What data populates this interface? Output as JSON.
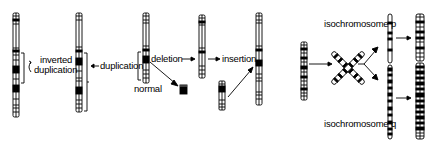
{
  "diagram": {
    "labels": {
      "inverted_duplication_line1": "inverted",
      "inverted_duplication_line2": "duplication",
      "duplication": "duplication",
      "normal": "normal",
      "deletion": "deletion",
      "insertion": "insertion",
      "isochromosome_p": "isochromosome p",
      "isochromosome_q": "isochromosome q"
    },
    "colors": {
      "ink": "#000000",
      "background": "#ffffff"
    },
    "chromosomes": [
      {
        "id": "inverted-duplication",
        "x": 13,
        "y": 13,
        "w": 6,
        "h": 104
      },
      {
        "id": "duplication",
        "x": 76,
        "y": 13,
        "w": 6,
        "h": 99
      },
      {
        "id": "normal",
        "x": 143,
        "y": 13,
        "w": 6,
        "h": 70
      },
      {
        "id": "deleted-fragment",
        "x": 180,
        "y": 85,
        "w": 7,
        "h": 9
      },
      {
        "id": "after-deletion",
        "x": 199,
        "y": 15,
        "w": 6,
        "h": 63
      },
      {
        "id": "insert-fragment",
        "x": 219,
        "y": 81,
        "w": 6,
        "h": 29
      },
      {
        "id": "after-insertion",
        "x": 256,
        "y": 13,
        "w": 6,
        "h": 92
      },
      {
        "id": "iso-source",
        "x": 301,
        "y": 42,
        "w": 6,
        "h": 58
      },
      {
        "id": "isochromosome-p",
        "x": 388,
        "y": 14,
        "w": 4,
        "h": 49
      },
      {
        "id": "isochromosome-q",
        "x": 388,
        "y": 63,
        "w": 4,
        "h": 76
      },
      {
        "id": "iso-p-result",
        "x": 416,
        "y": 14,
        "w": 8,
        "h": 47
      },
      {
        "id": "iso-q-result",
        "x": 416,
        "y": 63,
        "w": 8,
        "h": 76
      }
    ]
  }
}
